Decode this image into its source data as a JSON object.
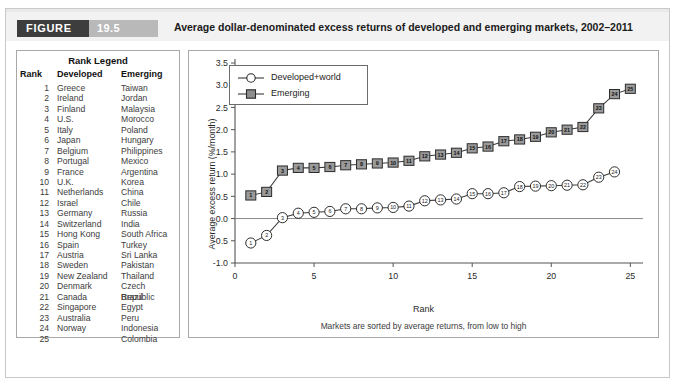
{
  "figure": {
    "badge_label": "FIGURE",
    "number": "19.5",
    "title": "Average dollar-denominated excess returns of developed and emerging markets, 2002–2011"
  },
  "rank_legend": {
    "title": "Rank Legend",
    "headers": [
      "Rank",
      "Developed",
      "Emerging"
    ],
    "rows": [
      [
        "1",
        "Greece",
        "Taiwan"
      ],
      [
        "2",
        "Ireland",
        "Jordan"
      ],
      [
        "3",
        "Finland",
        "Malaysia"
      ],
      [
        "4",
        "U.S.",
        "Morocco"
      ],
      [
        "5",
        "Italy",
        "Poland"
      ],
      [
        "6",
        "Japan",
        "Hungary"
      ],
      [
        "7",
        "Belgium",
        "Philippines"
      ],
      [
        "8",
        "Portugal",
        "Mexico"
      ],
      [
        "9",
        "France",
        "Argentina"
      ],
      [
        "10",
        "U.K.",
        "Korea"
      ],
      [
        "11",
        "Netherlands",
        "China"
      ],
      [
        "12",
        "Israel",
        "Chile"
      ],
      [
        "13",
        "Germany",
        "Russia"
      ],
      [
        "14",
        "Switzerland",
        "India"
      ],
      [
        "15",
        "Hong Kong",
        "South Africa"
      ],
      [
        "16",
        "Spain",
        "Turkey"
      ],
      [
        "17",
        "Austria",
        "Sri Lanka"
      ],
      [
        "18",
        "Sweden",
        "Pakistan"
      ],
      [
        "19",
        "New Zealand",
        "Thailand"
      ],
      [
        "20",
        "Denmark",
        "Czech Republic"
      ],
      [
        "21",
        "Canada",
        "Brazil"
      ],
      [
        "22",
        "Singapore",
        "Egypt"
      ],
      [
        "23",
        "Australia",
        "Peru"
      ],
      [
        "24",
        "Norway",
        "Indonesia"
      ],
      [
        "25",
        "",
        "Colombia"
      ]
    ]
  },
  "note": "Markets are sorted by average returns, from low to high",
  "colors": {
    "badge_dark": "#3d3d3d",
    "badge_light": "#b9b9b9",
    "header_bg": "#f2f2f2",
    "frame": "#a8a8a8",
    "emerging_marker": "#9a9a9a",
    "developed_marker": "#ffffff",
    "line": "#3a3a3a"
  },
  "chart_data": {
    "type": "line",
    "title": "Average dollar-denominated excess returns of developed and emerging markets, 2002–2011",
    "subtitle": "Markets are sorted by average returns, from low to high",
    "xlabel": "Rank",
    "ylabel": "Average excess return (%/month)",
    "xlim": [
      0,
      25.8
    ],
    "ylim": [
      -1.0,
      3.5
    ],
    "xticks": [
      0,
      5,
      10,
      15,
      20,
      25
    ],
    "xticklabels": [
      "0",
      "5",
      "10",
      "15",
      "20",
      "25"
    ],
    "yticks": [
      -1.0,
      -0.5,
      0.0,
      0.5,
      1.0,
      1.5,
      2.0,
      2.5,
      3.0,
      3.5
    ],
    "yticklabels": [
      "-1.0",
      "-0.5",
      "0.0",
      "0.5",
      "1.0",
      "1.5",
      "2.0",
      "2.5",
      "3.0",
      "3.5"
    ],
    "grid": false,
    "zero_line": true,
    "legend_position": "upper left",
    "x": [
      1,
      2,
      3,
      4,
      5,
      6,
      7,
      8,
      9,
      10,
      11,
      12,
      13,
      14,
      15,
      16,
      17,
      18,
      19,
      20,
      21,
      22,
      23,
      24,
      25
    ],
    "series": [
      {
        "name": "Developed+world",
        "marker": "circle",
        "values": [
          -0.55,
          -0.38,
          0.02,
          0.12,
          0.14,
          0.16,
          0.22,
          0.22,
          0.24,
          0.25,
          0.28,
          0.4,
          0.42,
          0.44,
          0.56,
          0.56,
          0.58,
          0.72,
          0.73,
          0.74,
          0.75,
          0.76,
          0.93,
          1.05,
          null
        ]
      },
      {
        "name": "Emerging",
        "marker": "square",
        "values": [
          0.52,
          0.6,
          1.08,
          1.14,
          1.14,
          1.16,
          1.2,
          1.22,
          1.24,
          1.26,
          1.3,
          1.4,
          1.44,
          1.48,
          1.58,
          1.62,
          1.74,
          1.78,
          1.84,
          1.94,
          2.0,
          2.06,
          2.48,
          2.8,
          2.92
        ]
      }
    ]
  }
}
